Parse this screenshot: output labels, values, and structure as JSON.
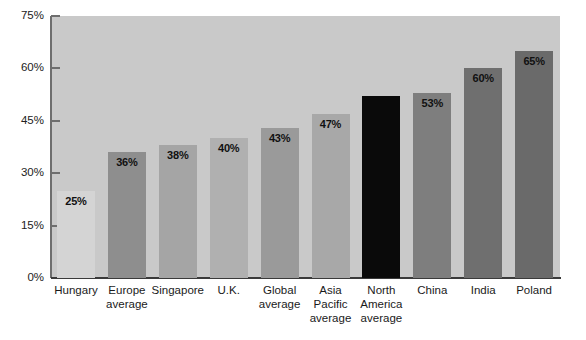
{
  "chart_data": {
    "type": "bar",
    "title": "",
    "subtitle": "",
    "xlabel": "",
    "ylabel": "",
    "ylim": [
      0,
      75
    ],
    "yticks": [
      0,
      15,
      30,
      45,
      60,
      75
    ],
    "ytick_labels": [
      "0%",
      "15%",
      "30%",
      "45%",
      "60%",
      "75%"
    ],
    "grid": false,
    "legend": null,
    "categories": [
      "Hungary",
      "Europe average",
      "Singapore",
      "U.K.",
      "Global average",
      "Asia Pacific average",
      "North America average",
      "China",
      "India",
      "Poland"
    ],
    "category_lines": [
      [
        "Hungary"
      ],
      [
        "Europe",
        "average"
      ],
      [
        "Singapore"
      ],
      [
        "U.K."
      ],
      [
        "Global",
        "average"
      ],
      [
        "Asia",
        "Pacific",
        "average"
      ],
      [
        "North",
        "America",
        "average"
      ],
      [
        "China"
      ],
      [
        "India"
      ],
      [
        "Poland"
      ]
    ],
    "values": [
      25,
      36,
      38,
      40,
      43,
      47,
      52,
      53,
      60,
      65
    ],
    "value_labels": [
      "25%",
      "36%",
      "38%",
      "40%",
      "43%",
      "47%",
      "",
      "53%",
      "60%",
      "65%"
    ],
    "bar_colors": [
      "#d4d4d4",
      "#8e8e8e",
      "#a5a5a5",
      "#b0b0b0",
      "#9a9a9a",
      "#a8a8a8",
      "#0a0a0a",
      "#7e7e7e",
      "#6f6f6f",
      "#6a6a6a"
    ],
    "plot_background": "#c9c9c9",
    "page_background": "#ffffff",
    "axis_color": "#3a3a3a"
  }
}
